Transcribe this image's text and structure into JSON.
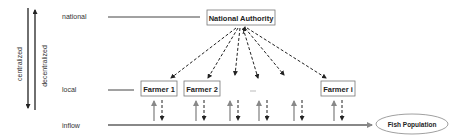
{
  "axis": {
    "centralized_label": "centralized",
    "decentralized_label": "decentralized"
  },
  "levels": {
    "national": "national",
    "local": "local",
    "inflow": "inflow"
  },
  "nodes": {
    "authority": "National Authority",
    "farmers": [
      "Farmer 1",
      "Farmer 2",
      "Farmer i"
    ],
    "ellipsis": "...",
    "fish_population": "Fish Population"
  },
  "colors": {
    "line": "#333333",
    "flow_arrow": "#777777",
    "box_border": "#666666"
  }
}
